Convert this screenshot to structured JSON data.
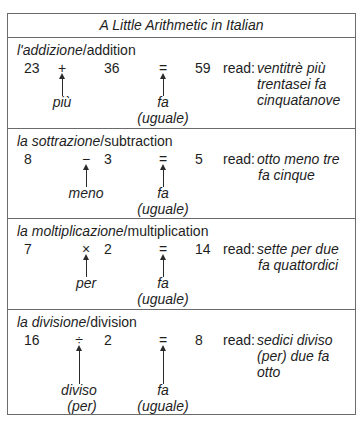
{
  "title": "A Little Arithmetic in Italian",
  "read_label": "read:",
  "sections": [
    {
      "italian": "l'addizione",
      "separator": "/",
      "english": "addition",
      "operand1": "23",
      "operator": "+",
      "operand2": "36",
      "equals": "=",
      "result": "59",
      "operator_word": [
        "più"
      ],
      "equals_word": [
        "fa",
        "(uguale)"
      ],
      "reading": [
        "ventitrè più",
        "trentasei fa",
        "cinquatanove"
      ]
    },
    {
      "italian": "la sottrazione",
      "separator": "/",
      "english": "subtraction",
      "operand1": "8",
      "operator": "−",
      "operand2": "3",
      "equals": "=",
      "result": "5",
      "operator_word": [
        "meno"
      ],
      "equals_word": [
        "fa",
        "(uguale)"
      ],
      "reading": [
        "otto meno tre",
        "fa cinque"
      ]
    },
    {
      "italian": "la moltiplicazione",
      "separator": "/",
      "english": "multiplication",
      "operand1": "7",
      "operator": "×",
      "operand2": "2",
      "equals": "=",
      "result": "14",
      "operator_word": [
        "per"
      ],
      "equals_word": [
        "fa",
        "(uguale)"
      ],
      "reading": [
        "sette per due",
        "fa quattordici"
      ]
    },
    {
      "italian": "la divisione",
      "separator": "/",
      "english": "division",
      "operand1": "16",
      "operator": "÷",
      "operand2": "2",
      "equals": "=",
      "result": "8",
      "operator_word": [
        "diviso",
        "(per)"
      ],
      "equals_word": [
        "fa",
        "(uguale)"
      ],
      "reading": [
        "sedici diviso",
        "(per) due fa",
        "otto"
      ]
    }
  ]
}
